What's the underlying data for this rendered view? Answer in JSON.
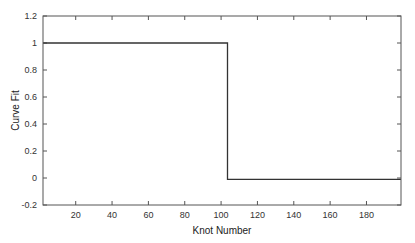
{
  "chart_data": {
    "type": "line",
    "title": "",
    "xlabel": "Knot Number",
    "ylabel": "Curve Fit",
    "xlim": [
      2,
      199
    ],
    "ylim": [
      -0.2,
      1.2
    ],
    "xticks": [
      20,
      40,
      60,
      80,
      100,
      120,
      140,
      160,
      180
    ],
    "yticks": [
      -0.2,
      0,
      0.2,
      0.4,
      0.6,
      0.8,
      1,
      1.2
    ],
    "xtick_labels": [
      "20",
      "40",
      "60",
      "80",
      "100",
      "120",
      "140",
      "160",
      "180"
    ],
    "ytick_labels": [
      "-0.2",
      "0",
      "0.2",
      "0.4",
      "0.6",
      "0.8",
      "1",
      "1.2"
    ],
    "grid": false,
    "legend": null,
    "series": [
      {
        "name": "curve-fit",
        "color": "#333333",
        "x": [
          2,
          103.5,
          103.5,
          199
        ],
        "y": [
          1.0,
          1.0,
          -0.01,
          -0.01
        ]
      }
    ]
  }
}
